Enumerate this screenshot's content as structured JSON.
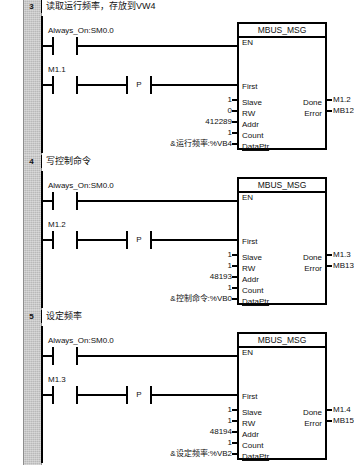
{
  "app": {
    "kind": "ladder-logic-editor",
    "block_name": "MBUS_MSG"
  },
  "labels": {
    "en": "EN",
    "first": "First",
    "slave": "Slave",
    "rw": "RW",
    "addr": "Addr",
    "count": "Count",
    "dataptr": "DataPtr",
    "done": "Done",
    "error": "Error",
    "p_contact": "P"
  },
  "networks": [
    {
      "number": "3",
      "title": "读取运行频率，存放到VW4",
      "rung1_contact": "Always_On:SM0.0",
      "rung2_contact": "M1.1",
      "edge_contact": "P",
      "block": "MBUS_MSG",
      "inputs": [
        {
          "value": "1",
          "pin": "Slave"
        },
        {
          "value": "0",
          "pin": "RW"
        },
        {
          "value": "412289",
          "pin": "Addr"
        },
        {
          "value": "1",
          "pin": "Count"
        },
        {
          "value": "&运行频率:%VB4",
          "pin": "DataPtr"
        }
      ],
      "outputs": [
        {
          "pin": "Done",
          "value": "M1.2"
        },
        {
          "pin": "Error",
          "value": "MB12"
        }
      ]
    },
    {
      "number": "4",
      "title": "写控制命令",
      "rung1_contact": "Always_On:SM0.0",
      "rung2_contact": "M1.2",
      "edge_contact": "P",
      "block": "MBUS_MSG",
      "inputs": [
        {
          "value": "1",
          "pin": "Slave"
        },
        {
          "value": "1",
          "pin": "RW"
        },
        {
          "value": "48193",
          "pin": "Addr"
        },
        {
          "value": "1",
          "pin": "Count"
        },
        {
          "value": "&控制命令:%VB0",
          "pin": "DataPtr"
        }
      ],
      "outputs": [
        {
          "pin": "Done",
          "value": "M1.3"
        },
        {
          "pin": "Error",
          "value": "MB13"
        }
      ]
    },
    {
      "number": "5",
      "title": "设定频率",
      "rung1_contact": "Always_On:SM0.0",
      "rung2_contact": "M1.3",
      "edge_contact": "P",
      "block": "MBUS_MSG",
      "inputs": [
        {
          "value": "1",
          "pin": "Slave"
        },
        {
          "value": "1",
          "pin": "RW"
        },
        {
          "value": "48194",
          "pin": "Addr"
        },
        {
          "value": "1",
          "pin": "Count"
        },
        {
          "value": "&设定频率:%VB2",
          "pin": "DataPtr"
        }
      ],
      "outputs": [
        {
          "pin": "Done",
          "value": "M1.4"
        },
        {
          "pin": "Error",
          "value": "MB15"
        }
      ]
    }
  ]
}
